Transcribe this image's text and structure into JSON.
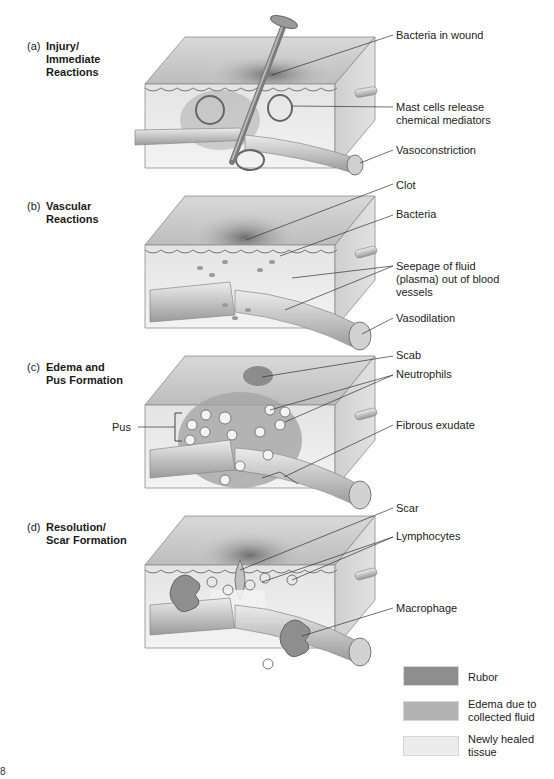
{
  "figure": {
    "panels": [
      {
        "letter": "(a)",
        "title": "Injury/\nImmediate\nReactions",
        "callouts": [
          "Bacteria in wound",
          "Mast cells release\nchemical mediators",
          "Vasoconstriction"
        ]
      },
      {
        "letter": "(b)",
        "title": "Vascular\nReactions",
        "callouts": [
          "Clot",
          "Bacteria",
          "Seepage of fluid\n(plasma) out of blood\nvessels",
          "Vasodilation"
        ]
      },
      {
        "letter": "(c)",
        "title": "Edema and\nPus Formation",
        "callouts": [
          "Scab",
          "Neutrophils",
          "Fibrous exudate"
        ],
        "left_callout": "Pus"
      },
      {
        "letter": "(d)",
        "title": "Resolution/\nScar Formation",
        "callouts": [
          "Scar",
          "Lymphocytes",
          "Macrophage"
        ]
      }
    ],
    "legend": [
      {
        "label": "Rubor",
        "color": "#8e8e8e"
      },
      {
        "label": "Edema due to\ncollected fluid",
        "color": "#b3b3b3"
      },
      {
        "label": "Newly healed\ntissue",
        "color": "#ececec"
      }
    ],
    "page_number": "8"
  }
}
